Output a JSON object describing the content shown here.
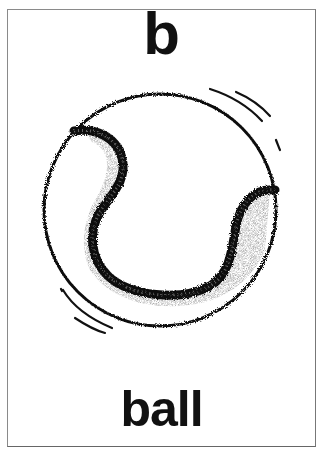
{
  "card": {
    "letter": "b",
    "word": "ball",
    "illustration": "tennis-ball-icon"
  },
  "colors": {
    "ink": "#111111",
    "background": "#ffffff",
    "border": "#8a8a8a"
  }
}
